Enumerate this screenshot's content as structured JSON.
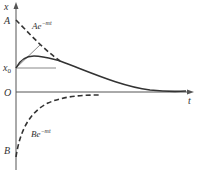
{
  "diagram": {
    "axes": {
      "y_label": "x",
      "x_label": "t",
      "origin_label": "O"
    },
    "markers": {
      "A": "A",
      "x0_base": "x",
      "x0_sub": "0",
      "B": "B"
    },
    "curves": {
      "upper_envelope": {
        "coef": "A",
        "exp": "e",
        "power": "−mt"
      },
      "lower_envelope": {
        "coef": "B",
        "exp": "e",
        "power": "−mt"
      }
    },
    "colors": {
      "curve": "#333333",
      "tangent": "#888888",
      "axis": "#555555"
    }
  }
}
